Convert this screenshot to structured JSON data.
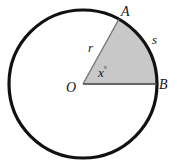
{
  "figure": {
    "kind": "circle-sector-geometry-diagram",
    "background_color": "#ffffff",
    "circle": {
      "center_x": 83,
      "center_y": 84,
      "radius": 74,
      "stroke_color": "#111111",
      "stroke_width": 3.2,
      "fill_color": "#ffffff"
    },
    "sector": {
      "fill_color": "#c8c8c8",
      "stroke_color": "#8a8a8a",
      "stroke_width": 1,
      "start_angle_deg": 0,
      "end_angle_deg": 61
    },
    "radii": [
      {
        "name": "OB",
        "from": "O",
        "to": "B",
        "label": "r_horizontal"
      },
      {
        "name": "OA",
        "from": "O",
        "to": "A",
        "label": "r"
      }
    ],
    "labels": {
      "point_a": "A",
      "point_b": "B",
      "center_o": "O",
      "radius": "r",
      "arc_length": "s",
      "angle_value": "x",
      "angle_unit": "°"
    }
  }
}
